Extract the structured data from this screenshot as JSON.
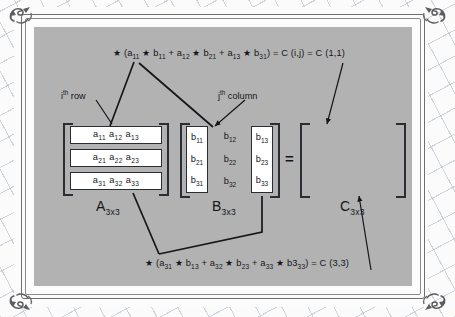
{
  "figure": {
    "panel_color": "#b2b2b2",
    "ink_color": "#14161a"
  },
  "formulas": {
    "top": {
      "star": "★",
      "text": "(a11 ★ b11 + a12 ★ b21 + a13 ★ b31) = C (i,j) = C (1,1)",
      "parts": [
        {
          "t": "★ ("
        },
        {
          "t": "a",
          "sub": "11"
        },
        {
          "t": " ★ "
        },
        {
          "t": "b",
          "sub": "11"
        },
        {
          "t": " + "
        },
        {
          "t": "a",
          "sub": "12"
        },
        {
          "t": " ★ "
        },
        {
          "t": "b",
          "sub": "21"
        },
        {
          "t": " + "
        },
        {
          "t": "a",
          "sub": "13"
        },
        {
          "t": " ★ "
        },
        {
          "t": "b",
          "sub": "31"
        },
        {
          "t": ") = C (i,j) = C (1,1)"
        }
      ]
    },
    "bottom": {
      "star": "★",
      "text": "(a31 ★ b13 + a32 ★ b23 + a33 ★ b333) = C (3,3)",
      "parts": [
        {
          "t": "★ ("
        },
        {
          "t": "a",
          "sub": "31"
        },
        {
          "t": " ★ "
        },
        {
          "t": "b",
          "sub": "13"
        },
        {
          "t": " + "
        },
        {
          "t": "a",
          "sub": "32"
        },
        {
          "t": " ★ "
        },
        {
          "t": "b",
          "sub": "23"
        },
        {
          "t": " + "
        },
        {
          "t": "a",
          "sub": "33"
        },
        {
          "t": " ★ "
        },
        {
          "t": "b3",
          "sub": "33"
        },
        {
          "t": ") = C (3,3)"
        }
      ]
    }
  },
  "annotations": {
    "ith_row": {
      "base": "i",
      "sup": "th",
      "rest": " row"
    },
    "jth_column": {
      "base": "j",
      "sup": "th",
      "rest": " column"
    }
  },
  "matrix_a": {
    "label_base": "A",
    "label_sub": "3x3",
    "rows": [
      [
        "a11",
        "a12",
        "a13"
      ],
      [
        "a21",
        "a22",
        "a23"
      ],
      [
        "a31",
        "a32",
        "a33"
      ]
    ],
    "cells": [
      [
        {
          "b": "a",
          "s": "11"
        },
        {
          "b": "a",
          "s": "12"
        },
        {
          "b": "a",
          "s": "13"
        }
      ],
      [
        {
          "b": "a",
          "s": "21"
        },
        {
          "b": "a",
          "s": "22"
        },
        {
          "b": "a",
          "s": "23"
        }
      ],
      [
        {
          "b": "a",
          "s": "31"
        },
        {
          "b": "a",
          "s": "32"
        },
        {
          "b": "a",
          "s": "33"
        }
      ]
    ],
    "highlighted_rows": [
      0,
      1,
      2
    ]
  },
  "matrix_b": {
    "label_base": "B",
    "label_sub": "3x3",
    "columns": [
      {
        "boxed": true,
        "cells": [
          {
            "b": "b",
            "s": "11"
          },
          {
            "b": "b",
            "s": "21"
          },
          {
            "b": "b",
            "s": "31"
          }
        ]
      },
      {
        "boxed": false,
        "cells": [
          {
            "b": "b",
            "s": "12"
          },
          {
            "b": "b",
            "s": "22"
          },
          {
            "b": "b",
            "s": "32"
          }
        ]
      },
      {
        "boxed": true,
        "cells": [
          {
            "b": "b",
            "s": "13"
          },
          {
            "b": "b",
            "s": "23"
          },
          {
            "b": "b",
            "s": "33"
          }
        ]
      }
    ]
  },
  "matrix_c": {
    "label_base": "C",
    "label_sub": "3x3",
    "equals": "=",
    "grid": [
      [
        "box",
        "dash",
        "dash"
      ],
      [
        "dash",
        "dash",
        "dash"
      ],
      [
        "dash",
        "dash",
        "box"
      ]
    ]
  }
}
